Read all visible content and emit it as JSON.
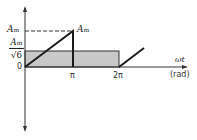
{
  "diagram": {
    "y_labels": {
      "peak": "A",
      "peak_sub": "m",
      "rms_num": "A",
      "rms_num_sub": "m",
      "rms_den": "√6",
      "zero": "0"
    },
    "peak_annotation": "A",
    "peak_annotation_sub": "m",
    "x_ticks": [
      "π",
      "2π"
    ],
    "x_axis_label": "ωt",
    "x_axis_unit": "(rad)",
    "colors": {
      "line": "#1a1a1a",
      "shaded": "#c8c8c8",
      "axis": "#333333"
    }
  }
}
